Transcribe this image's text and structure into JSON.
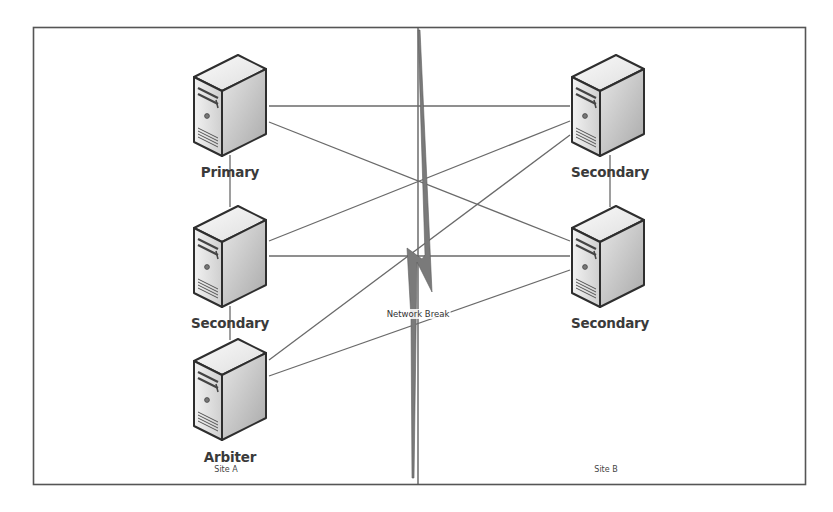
{
  "diagram": {
    "type": "network-topology",
    "colors": {
      "frame": "#555555",
      "link": "#6a6a6a",
      "bolt": "#7a7a7a",
      "server_outline": "#2e2e2e",
      "server_front": "#d9d9d9",
      "server_side": "#b8b8b8",
      "server_top": "#eeeeee",
      "text": "#3a3a3a"
    },
    "sites": [
      {
        "id": "site_a",
        "label": "Site A"
      },
      {
        "id": "site_b",
        "label": "Site B"
      }
    ],
    "nodes": [
      {
        "id": "a_primary",
        "site": "site_a",
        "label": "Primary",
        "icon": "server-icon"
      },
      {
        "id": "a_secondary",
        "site": "site_a",
        "label": "Secondary",
        "icon": "server-icon"
      },
      {
        "id": "a_arbiter",
        "site": "site_a",
        "label": "Arbiter",
        "icon": "server-icon"
      },
      {
        "id": "b_secondary_1",
        "site": "site_b",
        "label": "Secondary",
        "icon": "server-icon"
      },
      {
        "id": "b_secondary_2",
        "site": "site_b",
        "label": "Secondary",
        "icon": "server-icon"
      }
    ],
    "links": [
      {
        "from": "a_primary",
        "to": "a_secondary"
      },
      {
        "from": "a_secondary",
        "to": "a_arbiter"
      },
      {
        "from": "b_secondary_1",
        "to": "b_secondary_2"
      },
      {
        "from": "a_primary",
        "to": "b_secondary_1"
      },
      {
        "from": "a_primary",
        "to": "b_secondary_2"
      },
      {
        "from": "a_secondary",
        "to": "b_secondary_1"
      },
      {
        "from": "a_secondary",
        "to": "b_secondary_2"
      },
      {
        "from": "a_arbiter",
        "to": "b_secondary_1"
      },
      {
        "from": "a_arbiter",
        "to": "b_secondary_2"
      }
    ],
    "network_break": {
      "label": "Network Break",
      "icon": "lightning-bolt-icon"
    }
  }
}
